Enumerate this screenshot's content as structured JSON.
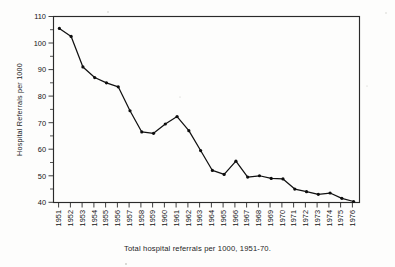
{
  "chart_data": {
    "type": "line",
    "title": "",
    "caption": "Total hospital referrals per 1000, 1951-70.",
    "xlabel": "",
    "ylabel": "Hospital Referrals per 1000",
    "ylim": [
      40,
      110
    ],
    "y_ticks": [
      40,
      50,
      60,
      70,
      80,
      90,
      100,
      110
    ],
    "y_minor_ticks": [
      45,
      55,
      65,
      75,
      85,
      95,
      105
    ],
    "grid": false,
    "legend": "none",
    "marker": "filled-circle",
    "categories": [
      "1951",
      "1952",
      "1953",
      "1954",
      "1955",
      "1956",
      "1957",
      "1958",
      "1959",
      "1960",
      "1961",
      "1962",
      "1963",
      "1964",
      "1965",
      "1966",
      "1967",
      "1968",
      "1969",
      "1970",
      "1971",
      "1972",
      "1973",
      "1974",
      "1975",
      "1976"
    ],
    "values": [
      105.5,
      102.5,
      91.0,
      87.0,
      85.0,
      83.5,
      74.5,
      66.5,
      66.0,
      69.5,
      72.3,
      67.0,
      59.5,
      52.0,
      50.5,
      55.5,
      49.5,
      50.0,
      49.0,
      48.8,
      45.0,
      44.0,
      43.0,
      43.5,
      41.5,
      40.3
    ],
    "series": [
      {
        "name": "Total hospital referrals per 1000",
        "values": [
          105.5,
          102.5,
          91.0,
          87.0,
          85.0,
          83.5,
          74.5,
          66.5,
          66.0,
          69.5,
          72.3,
          67.0,
          59.5,
          52.0,
          50.5,
          55.5,
          49.5,
          50.0,
          49.0,
          48.8,
          45.0,
          44.0,
          43.0,
          43.5,
          41.5,
          40.3
        ]
      }
    ],
    "colors": {
      "line": "#111111",
      "marker": "#0d0d0d",
      "frame": "#2a2a2a",
      "text": "#1a1a1a",
      "background": "#fdfdfc"
    }
  }
}
